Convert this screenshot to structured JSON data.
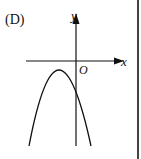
{
  "option_label": "(D)",
  "axes": {
    "x_label": "x",
    "y_label": "y",
    "origin_label": "O"
  },
  "graph": {
    "type": "parabola",
    "opens": "downward",
    "vertex_quadrant": "third (left of y-axis, below x-axis)",
    "y_intercept": "negative"
  },
  "colors": {
    "ink": "#111111",
    "background": "#ffffff"
  }
}
